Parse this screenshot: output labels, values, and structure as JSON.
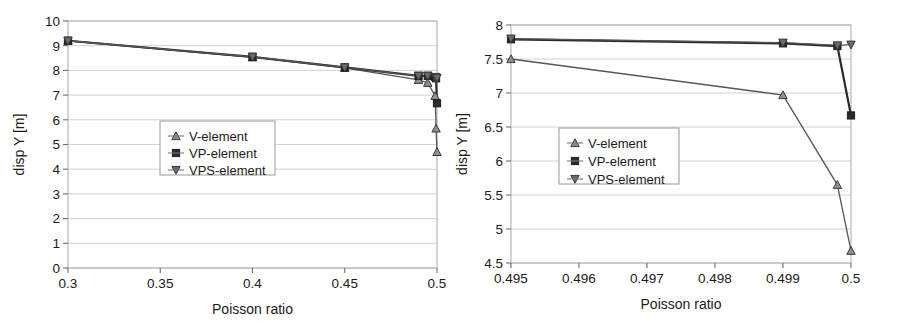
{
  "figure": {
    "panels": [
      "left",
      "right"
    ]
  },
  "chart_data": [
    {
      "type": "line",
      "panel": "left",
      "title": "",
      "xlabel": "Poisson ratio",
      "ylabel": "disp Y [m]",
      "xlim": [
        0.3,
        0.5
      ],
      "ylim": [
        0,
        10
      ],
      "xticks": [
        0.3,
        0.35,
        0.4,
        0.45,
        0.5
      ],
      "xticklabels": [
        "0.3",
        "0.35",
        "0.4",
        "0.45",
        "0.5"
      ],
      "yticks": [
        0,
        1,
        2,
        3,
        4,
        5,
        6,
        7,
        8,
        9,
        10
      ],
      "yticklabels": [
        "0",
        "1",
        "2",
        "3",
        "4",
        "5",
        "6",
        "7",
        "8",
        "9",
        "10"
      ],
      "grid": true,
      "legend_position": "center-left",
      "series": [
        {
          "name": "V-element",
          "marker": "triangle-up",
          "color": "#8f8f8f",
          "x": [
            0.3,
            0.4,
            0.45,
            0.49,
            0.495,
            0.499,
            0.4995,
            0.5
          ],
          "y": [
            9.2,
            8.53,
            8.1,
            7.62,
            7.5,
            6.97,
            5.65,
            4.7
          ]
        },
        {
          "name": "VP-element",
          "marker": "square",
          "color": "#2b2b2b",
          "x": [
            0.3,
            0.4,
            0.45,
            0.49,
            0.495,
            0.499,
            0.4995,
            0.5
          ],
          "y": [
            9.2,
            8.55,
            8.12,
            7.78,
            7.78,
            7.73,
            7.68,
            6.67
          ]
        },
        {
          "name": "VPS-element",
          "marker": "triangle-down",
          "color": "#6a6a6a",
          "x": [
            0.3,
            0.4,
            0.45,
            0.49,
            0.495,
            0.499,
            0.4995,
            0.5
          ],
          "y": [
            9.2,
            8.55,
            8.12,
            7.78,
            7.78,
            7.73,
            7.69,
            7.7
          ]
        }
      ]
    },
    {
      "type": "line",
      "panel": "right",
      "title": "",
      "xlabel": "Poisson ratio",
      "ylabel": "disp Y [m]",
      "xlim": [
        0.495,
        0.5
      ],
      "ylim": [
        4.5,
        8
      ],
      "xticks": [
        0.495,
        0.496,
        0.497,
        0.498,
        0.499,
        0.5
      ],
      "xticklabels": [
        "0.495",
        "0.496",
        "0.497",
        "0.498",
        "0.499",
        "0.5"
      ],
      "yticks": [
        4.5,
        5,
        5.5,
        6,
        6.5,
        7,
        7.5,
        8
      ],
      "yticklabels": [
        "4.5",
        "5",
        "5.5",
        "6",
        "6.5",
        "7",
        "7.5",
        "8"
      ],
      "grid": true,
      "legend_position": "center-left",
      "series": [
        {
          "name": "V-element",
          "marker": "triangle-up",
          "color": "#8f8f8f",
          "x": [
            0.495,
            0.499,
            0.4998,
            0.5
          ],
          "y": [
            7.5,
            6.97,
            5.65,
            4.68
          ]
        },
        {
          "name": "VP-element",
          "marker": "square",
          "color": "#2b2b2b",
          "x": [
            0.495,
            0.499,
            0.4998,
            0.5
          ],
          "y": [
            7.79,
            7.73,
            7.69,
            6.67
          ]
        },
        {
          "name": "VPS-element",
          "marker": "triangle-down",
          "color": "#6a6a6a",
          "x": [
            0.495,
            0.499,
            0.4998,
            0.5
          ],
          "y": [
            7.8,
            7.74,
            7.7,
            7.71
          ]
        }
      ]
    }
  ]
}
